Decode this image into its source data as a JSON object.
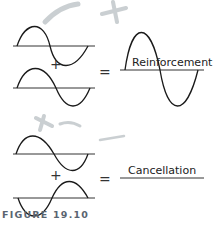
{
  "figure": {
    "caption": "FIGURE 19.10",
    "operators": {
      "plus": "+",
      "equals": "="
    },
    "panels": [
      {
        "name": "reinforcement",
        "result_label": "Reinforcement",
        "description": "Two in-phase waves add to a wave of double amplitude"
      },
      {
        "name": "cancellation",
        "result_label": "Cancellation",
        "description": "Two out-of-phase waves cancel to a flat line"
      }
    ],
    "colors": {
      "wave": "#1a1a1a",
      "axis": "#333333",
      "caption": "#5a6470",
      "marker_smudge": "#9aa3a8"
    }
  }
}
